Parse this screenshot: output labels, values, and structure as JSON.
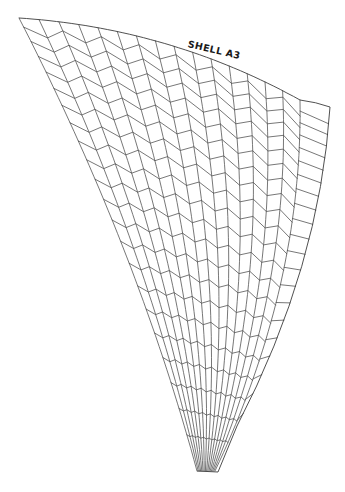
{
  "diagram": {
    "title": "SHELL A3",
    "type": "shell tile pattern (herringbone chevron mesh)",
    "stroke_color": "#4a4a4a",
    "background": "#ffffff"
  },
  "geometry": {
    "left_edge": {
      "start": [
        19,
        18
      ],
      "control": [
        136,
        245
      ],
      "end": [
        197,
        471
      ]
    },
    "inner_right_edge": {
      "start": [
        300,
        100
      ],
      "control": [
        303,
        285
      ],
      "end": [
        215,
        471
      ]
    },
    "outer_right_edge": {
      "start": [
        330,
        107
      ],
      "control": [
        320,
        266
      ],
      "end": [
        237,
        426
      ]
    },
    "outer_tail_end": [
      218,
      472
    ],
    "top_arc_control": [
      170,
      28
    ],
    "top_outer_arc_control": [
      316,
      102
    ],
    "column_lines": 16,
    "row_count": 21,
    "row_spacing_start": 13,
    "row_spacing_growth": 0.6,
    "row_tail_gap": 34,
    "chevron_amplitude_ratio": 0.26,
    "outer_rung_limit": 0.9
  }
}
